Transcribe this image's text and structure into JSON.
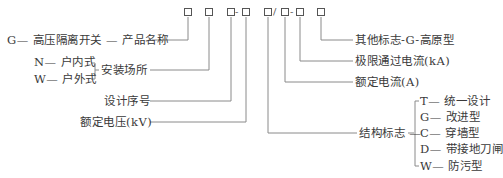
{
  "code_template": {
    "boxes": [
      "□",
      "□",
      "□",
      "□",
      "□",
      "□",
      "□",
      "□"
    ],
    "separators": {
      "box3_box4": "-",
      "box5_box6": "/",
      "box6_box7": "-"
    }
  },
  "left_labels": {
    "product_name": {
      "prefix": "G— 高压隔离开关 — ",
      "label": "产品名称"
    },
    "install_location": {
      "label": "安装场所",
      "options": [
        {
          "code": "N",
          "text": "N— 户内式"
        },
        {
          "code": "W",
          "text": "W— 户外式"
        }
      ]
    },
    "design_serial": "设计序号",
    "rated_voltage": "额定电压(kV)"
  },
  "right_labels": {
    "other_mark": "其他标志-G-高原型",
    "limit_current": "极限通过电流(kA)",
    "rated_current": "额定电流(A)",
    "structure_mark": {
      "label": "结构标志 —",
      "options": [
        {
          "code": "T",
          "text": "T— 统一设计"
        },
        {
          "code": "G",
          "text": "G— 改进型"
        },
        {
          "code": "C",
          "text": "C— 穿墙型"
        },
        {
          "code": "D",
          "text": "D— 带接地刀闸"
        },
        {
          "code": "W",
          "text": "W— 防污型"
        }
      ]
    }
  },
  "colors": {
    "line": "#8a8a8a",
    "text": "#3a3a3a",
    "box_border": "#555555"
  }
}
